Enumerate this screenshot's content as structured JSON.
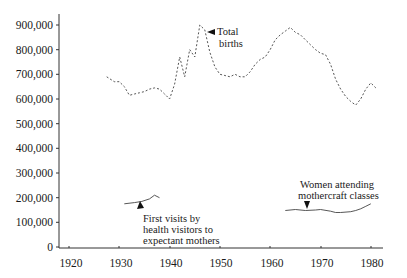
{
  "chart_data": {
    "type": "line",
    "title": "",
    "xlabel": "",
    "ylabel": "",
    "xlim": [
      1917,
      1982
    ],
    "ylim": [
      0,
      950000
    ],
    "grid": false,
    "x_ticks": [
      1920,
      1930,
      1940,
      1950,
      1960,
      1970,
      1980
    ],
    "x_tick_labels": [
      "1920",
      "1930",
      "1940",
      "1950",
      "1960",
      "1970",
      "1980"
    ],
    "y_ticks": [
      0,
      100000,
      200000,
      300000,
      400000,
      500000,
      600000,
      700000,
      800000,
      900000
    ],
    "y_tick_labels": [
      "0",
      "100,000",
      "200,000",
      "300,000",
      "400,000",
      "500,000",
      "600,000",
      "700,000",
      "800,000",
      "900,000"
    ],
    "series": [
      {
        "name": "Total births",
        "style": "dashed",
        "x": [
          1927.5,
          1929,
          1930,
          1931,
          1932,
          1933,
          1934,
          1935,
          1936,
          1937,
          1938,
          1939,
          1940,
          1941,
          1942,
          1943,
          1944,
          1945,
          1946,
          1947,
          1948,
          1949,
          1950,
          1951,
          1952,
          1953,
          1954,
          1955,
          1956,
          1957,
          1958,
          1959,
          1960,
          1961,
          1962,
          1963,
          1964,
          1965,
          1966,
          1967,
          1968,
          1969,
          1970,
          1971,
          1972,
          1973,
          1974,
          1975,
          1976,
          1977,
          1978,
          1979,
          1980,
          1981
        ],
        "values": [
          690000,
          670000,
          670000,
          650000,
          615000,
          620000,
          625000,
          630000,
          640000,
          645000,
          640000,
          620000,
          600000,
          660000,
          770000,
          690000,
          800000,
          770000,
          900000,
          880000,
          790000,
          730000,
          700000,
          695000,
          690000,
          700000,
          690000,
          690000,
          710000,
          740000,
          760000,
          770000,
          800000,
          840000,
          860000,
          875000,
          890000,
          870000,
          860000,
          840000,
          820000,
          800000,
          785000,
          780000,
          740000,
          680000,
          640000,
          610000,
          590000,
          575000,
          600000,
          640000,
          665000,
          645000
        ]
      },
      {
        "name": "First visits by health visitors to expectant mothers",
        "style": "solid",
        "x": [
          1931,
          1933,
          1934.5,
          1936,
          1937,
          1938
        ],
        "values": [
          175000,
          180000,
          185000,
          195000,
          210000,
          200000
        ]
      },
      {
        "name": "Women attending mothercraft classes",
        "style": "solid",
        "x": [
          1963,
          1965,
          1967,
          1969,
          1970,
          1972,
          1973,
          1974,
          1976,
          1977,
          1978,
          1979,
          1980
        ],
        "values": [
          148000,
          152000,
          148000,
          150000,
          152000,
          145000,
          140000,
          140000,
          143000,
          148000,
          155000,
          165000,
          175000
        ]
      }
    ],
    "annotations": [
      {
        "text": [
          "Total",
          "births"
        ],
        "arrow_to": [
          1946.5,
          870000
        ]
      },
      {
        "text": [
          "First visits by",
          "health visitors to",
          "expectant mothers"
        ],
        "arrow_to": [
          1935,
          180000
        ]
      },
      {
        "text": [
          "Women attending",
          "mothercraft classes"
        ],
        "arrow_to": [
          1967,
          160000
        ]
      }
    ]
  },
  "labels": {
    "births_line1": "Total",
    "births_line2": "births",
    "visits_line1": "First visits by",
    "visits_line2": "health visitors to",
    "visits_line3": "expectant mothers",
    "women_line1": "Women attending",
    "women_line2": "mothercraft classes"
  },
  "axes": {
    "y": [
      "0",
      "100,000",
      "200,000",
      "300,000",
      "400,000",
      "500,000",
      "600,000",
      "700,000",
      "800,000",
      "900,000"
    ],
    "x": [
      "1920",
      "1930",
      "1940",
      "1950",
      "1960",
      "1970",
      "1980"
    ]
  }
}
